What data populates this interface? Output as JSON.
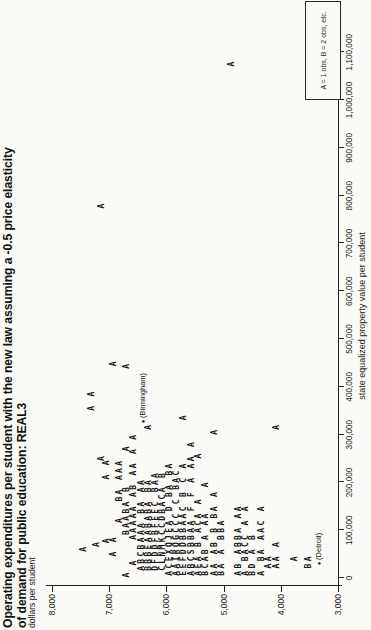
{
  "title": {
    "line1": "Operating expenditures per student with the new law assuming a -0.5 price elasticity",
    "line2": "of demand for public education: REAL3"
  },
  "chart_data": {
    "type": "scatter",
    "plot_style": "character-plot (letter = number of observations at that position)",
    "title": "Operating expenditures per student with the new law assuming a -0.5 price elasticity of demand for public education: REAL3",
    "xlabel": "state equalized property value per student",
    "ylabel": "dollars per student",
    "xlim": [
      0,
      1100000
    ],
    "ylim": [
      3000,
      8000
    ],
    "x_ticks": [
      0,
      100000,
      200000,
      300000,
      400000,
      500000,
      600000,
      700000,
      800000,
      900000,
      1000000,
      1100000
    ],
    "y_ticks": [
      3000,
      4000,
      5000,
      6000,
      7000,
      8000
    ],
    "legend": "A = 1 obs, B = 2 obs, etc.",
    "legend_position": "bottom-right",
    "grid": false,
    "orientation_note": "chart printed rotated 90deg counterclockwise on portrait page",
    "rows": [
      {
        "y": 7425,
        "seg": [
          {
            "x": 60000,
            "t": "A"
          }
        ]
      },
      {
        "y": 7300,
        "seg": [
          {
            "x": 355000,
            "t": "A A"
          }
        ]
      },
      {
        "y": 7200,
        "seg": [
          {
            "x": 70000,
            "t": "A"
          }
        ]
      },
      {
        "y": 7125,
        "seg": [
          {
            "x": 250000,
            "t": "A"
          },
          {
            "x": 778000,
            "t": "A"
          }
        ]
      },
      {
        "y": 7025,
        "seg": [
          {
            "x": 78000,
            "t": "A"
          },
          {
            "x": 211000,
            "t": "A A"
          }
        ]
      },
      {
        "y": 6900,
        "seg": [
          {
            "x": 50000,
            "t": "A A"
          },
          {
            "x": 448000,
            "t": "A"
          }
        ]
      },
      {
        "y": 6800,
        "seg": [
          {
            "x": 120000,
            "t": "A"
          },
          {
            "x": 165000,
            "t": "BA AAA"
          }
        ]
      },
      {
        "y": 6675,
        "seg": [
          {
            "x": 6000,
            "t": "A"
          },
          {
            "x": 95000,
            "t": "BAABA B"
          },
          {
            "x": 270000,
            "t": "A"
          },
          {
            "x": 443000,
            "t": "A"
          }
        ]
      },
      {
        "y": 6550,
        "seg": [
          {
            "x": 31000,
            "t": "A"
          },
          {
            "x": 85000,
            "t": "AAAAA AB AA A A"
          }
        ]
      },
      {
        "y": 6425,
        "seg": [
          {
            "x": 20000,
            "t": "ABCBAAA BA AA"
          }
        ]
      },
      {
        "y": 6300,
        "seg": [
          {
            "x": 20000,
            "t": "BBBEAABABA BA"
          },
          {
            "x": 315000,
            "t": "A"
          }
        ]
      },
      {
        "y": 6175,
        "seg": [
          {
            "x": 20000,
            "t": "DFDDFBFEEC BAA"
          }
        ]
      },
      {
        "y": 6050,
        "seg": [
          {
            "x": 20000,
            "t": "CLNMKCCDBACA B"
          }
        ]
      },
      {
        "y": 5925,
        "seg": [
          {
            "x": 10000,
            "t": "ACEXQJEA D BA BA"
          }
        ]
      },
      {
        "y": 5800,
        "seg": [
          {
            "x": 10000,
            "t": "AAIRQGCCC C BAC"
          }
        ]
      },
      {
        "y": 5675,
        "seg": [
          {
            "x": 10000,
            "t": "EEFDDBBAAC B C A"
          },
          {
            "x": 335000,
            "t": "A"
          }
        ]
      },
      {
        "y": 5550,
        "seg": [
          {
            "x": 10000,
            "t": "ABCSBBAA F F A AA A"
          }
        ]
      },
      {
        "y": 5425,
        "seg": [
          {
            "x": 10000,
            "t": "AEA B ACA A"
          },
          {
            "x": 255000,
            "t": "A"
          }
        ]
      },
      {
        "y": 5300,
        "seg": [
          {
            "x": 10000,
            "t": "BCAB A AA"
          },
          {
            "x": 195000,
            "t": "A"
          }
        ]
      },
      {
        "y": 5150,
        "seg": [
          {
            "x": 10000,
            "t": "AA AB B BA A"
          },
          {
            "x": 305000,
            "t": "A"
          }
        ]
      },
      {
        "y": 5025,
        "seg": [
          {
            "x": 10000,
            "t": "BA A BBA"
          }
        ]
      },
      {
        "y": 4850,
        "seg": [
          {
            "x": 1075000,
            "t": "A"
          }
        ]
      },
      {
        "y": 4725,
        "seg": [
          {
            "x": 10000,
            "t": "AB ABBA AA"
          }
        ]
      },
      {
        "y": 4600,
        "seg": [
          {
            "x": 10000,
            "t": "A BACC A A"
          }
        ]
      },
      {
        "y": 4475,
        "seg": [
          {
            "x": 10000,
            "t": "BD A B"
          }
        ]
      },
      {
        "y": 4325,
        "seg": [
          {
            "x": 10000,
            "t": "A BA AAC A"
          }
        ]
      },
      {
        "y": 4200,
        "seg": [
          {
            "x": 25000,
            "t": "AA"
          }
        ]
      },
      {
        "y": 4050,
        "seg": [
          {
            "x": 25000,
            "t": "AA A"
          },
          {
            "x": 315000,
            "t": "A"
          }
        ]
      },
      {
        "y": 3750,
        "seg": [
          {
            "x": 40000,
            "t": "A"
          }
        ]
      },
      {
        "y": 3500,
        "seg": [
          {
            "x": 25000,
            "t": "BA"
          }
        ]
      }
    ],
    "annotations": [
      {
        "label": "(Birmingham)",
        "x": 328000,
        "y": 6425
      },
      {
        "label": "(Detroit)",
        "x": 31000,
        "y": 3350
      }
    ]
  }
}
